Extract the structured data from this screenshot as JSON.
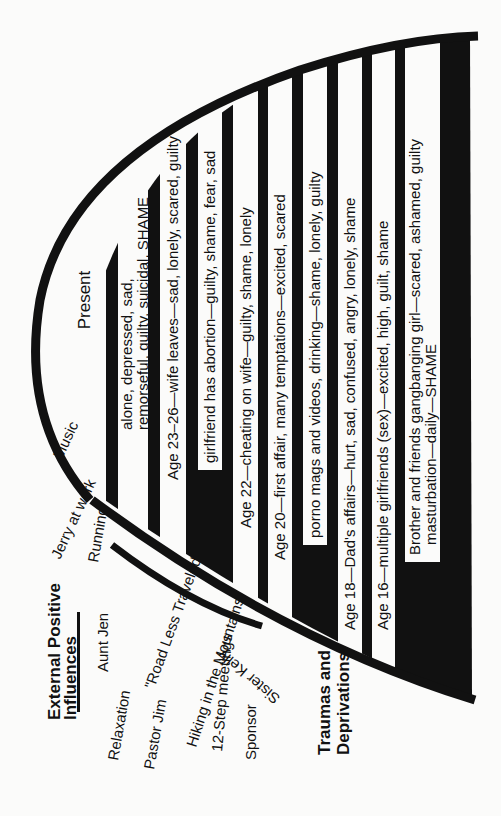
{
  "diagram": {
    "present_label": "Present",
    "colors": {
      "ink": "#111111",
      "paper": "#fbfbfa",
      "strip": "#f8f8f6"
    },
    "strips": [
      {
        "id": "present-feelings",
        "lines": [
          "alone, depressed, sad,",
          "remorseful, guilty, suicidal, SHAME"
        ]
      },
      {
        "id": "age-23-26",
        "lines": [
          "Age 23–26—wife leaves—sad, lonely, scared, guilty"
        ]
      },
      {
        "id": "girlfriend-abortion",
        "lines": [
          "girlfriend has abortion—guilty, shame, fear, sad"
        ]
      },
      {
        "id": "age-22",
        "lines": [
          "Age 22—cheating on wife—guilty, shame, lonely"
        ]
      },
      {
        "id": "age-20",
        "lines": [
          "Age 20—first affair, many temptations—excited, scared"
        ]
      },
      {
        "id": "porno",
        "lines": [
          "porno mags and videos, drinking—shame, lonely, guilty"
        ]
      },
      {
        "id": "age-18",
        "lines": [
          "Age 18—Dad's affairs—hurt, sad, confused, angry, lonely, shame"
        ]
      },
      {
        "id": "age-16",
        "lines": [
          "Age 16—multiple girlfriends (sex)—excited, high, guilt, shame"
        ]
      },
      {
        "id": "childhood",
        "lines": [
          "Brother and friends gangbanging girl—scared, ashamed, guilty",
          "masturbation—daily—SHAME"
        ]
      }
    ],
    "traumas_title": [
      "Traumas and",
      "Deprivations"
    ],
    "influences_title": [
      "External Positive",
      "Influences"
    ],
    "influences": [
      "Music",
      "Jerry at work",
      "Running",
      "Aunt Jen",
      "Relaxation",
      "Pastor Jim",
      "\"Road Less Traveled\"",
      "Hiking in the Mountains",
      "12-Step meetings",
      "Sponsor",
      "Sister Kelly"
    ]
  }
}
